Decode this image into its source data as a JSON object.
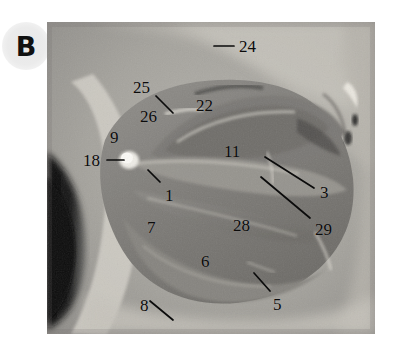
{
  "figure": {
    "panel_letter": "B",
    "type": "anatomical dissection photograph",
    "color_mode": "grayscale",
    "photo": {
      "left": 47,
      "top": 22,
      "width": 328,
      "height": 312,
      "background_hex": "#9a9a9a",
      "dark_region_hex": "#0d0d0d",
      "bone_light_hex": "#d9d6cf",
      "tissue_mid_hex": "#8c8c8c",
      "tissue_dark_hex": "#6e6e6e"
    }
  },
  "labels": [
    {
      "id": "24",
      "text": "24",
      "x": 239,
      "y": 38,
      "leader": {
        "x1": 214,
        "y1": 46,
        "x2": 234,
        "y2": 46
      }
    },
    {
      "id": "25",
      "text": "25",
      "x": 133,
      "y": 79,
      "leader": {
        "x1": 156,
        "y1": 96,
        "x2": 173,
        "y2": 113
      }
    },
    {
      "id": "26",
      "text": "26",
      "x": 140,
      "y": 108,
      "leader": null
    },
    {
      "id": "22",
      "text": "22",
      "x": 196,
      "y": 97,
      "leader": null
    },
    {
      "id": "9",
      "text": "9",
      "x": 110,
      "y": 129,
      "leader": null
    },
    {
      "id": "11",
      "text": "11",
      "x": 224,
      "y": 143,
      "leader": null
    },
    {
      "id": "18",
      "text": "18",
      "x": 83,
      "y": 152,
      "leader": {
        "x1": 107,
        "y1": 160,
        "x2": 124,
        "y2": 160
      }
    },
    {
      "id": "1",
      "text": "1",
      "x": 165,
      "y": 187,
      "leader": {
        "x1": 160,
        "y1": 182,
        "x2": 148,
        "y2": 170
      }
    },
    {
      "id": "3",
      "text": "3",
      "x": 320,
      "y": 184,
      "leader": {
        "x1": 314,
        "y1": 188,
        "x2": 265,
        "y2": 157
      }
    },
    {
      "id": "29",
      "text": "29",
      "x": 315,
      "y": 221,
      "leader": {
        "x1": 310,
        "y1": 218,
        "x2": 261,
        "y2": 177
      }
    },
    {
      "id": "7",
      "text": "7",
      "x": 147,
      "y": 219,
      "leader": null
    },
    {
      "id": "28",
      "text": "28",
      "x": 233,
      "y": 217,
      "leader": null
    },
    {
      "id": "6",
      "text": "6",
      "x": 201,
      "y": 253,
      "leader": null
    },
    {
      "id": "5",
      "text": "5",
      "x": 273,
      "y": 296,
      "leader": {
        "x1": 270,
        "y1": 291,
        "x2": 254,
        "y2": 273
      }
    },
    {
      "id": "8",
      "text": "8",
      "x": 140,
      "y": 297,
      "leader": {
        "x1": 150,
        "y1": 301,
        "x2": 173,
        "y2": 320
      }
    }
  ]
}
